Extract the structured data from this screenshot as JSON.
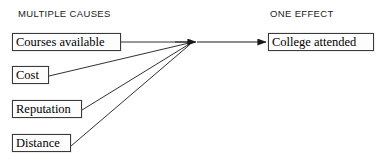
{
  "diagram": {
    "type": "cause-and-effect",
    "headings": {
      "causes": "MULTIPLE CAUSES",
      "effect": "ONE EFFECT"
    },
    "causes": [
      {
        "label": "Courses available"
      },
      {
        "label": "Cost"
      },
      {
        "label": "Reputation"
      },
      {
        "label": "Distance"
      }
    ],
    "effect": {
      "label": "College attended"
    },
    "colors": {
      "background": "#ffffff",
      "box_border": "#3a3a3a",
      "box_fill": "#fdfdfd",
      "text": "#000000",
      "heading_text": "#1a1a1a",
      "edge": "#1a1a1a"
    },
    "edges": [
      {
        "from": "Courses available",
        "to": "convergence"
      },
      {
        "from": "Cost",
        "to": "convergence"
      },
      {
        "from": "Reputation",
        "to": "convergence"
      },
      {
        "from": "Distance",
        "to": "convergence"
      },
      {
        "from": "convergence",
        "to": "College attended"
      }
    ]
  }
}
